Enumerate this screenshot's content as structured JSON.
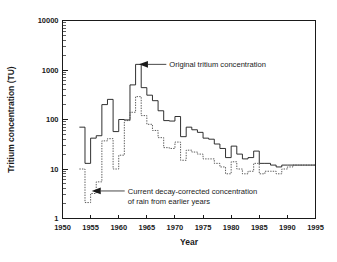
{
  "chart_data": {
    "type": "line",
    "title": "",
    "xlabel": "Year",
    "ylabel": "Tritium concentration (TU)",
    "xlim": [
      1950,
      1995
    ],
    "ylim": [
      1,
      10000
    ],
    "yscale": "log",
    "xscale": "linear",
    "grid": false,
    "legend_position": "none",
    "xticks": [
      1950,
      1955,
      1960,
      1965,
      1970,
      1975,
      1980,
      1985,
      1990,
      1995
    ],
    "xtick_labels": [
      "1950",
      "1955",
      "1960",
      "1965",
      "1970",
      "1975",
      "1980",
      "1985",
      "1990",
      "1995"
    ],
    "yticks": [
      1,
      10,
      100,
      1000,
      10000
    ],
    "ytick_labels": [
      "1",
      "10",
      "100",
      "1000",
      "10000"
    ],
    "plot_style": "step",
    "x": [
      1953,
      1954,
      1955,
      1956,
      1957,
      1958,
      1959,
      1960,
      1961,
      1962,
      1963,
      1964,
      1965,
      1966,
      1967,
      1968,
      1969,
      1970,
      1971,
      1972,
      1973,
      1974,
      1975,
      1976,
      1977,
      1978,
      1979,
      1980,
      1981,
      1982,
      1983,
      1984,
      1985,
      1986,
      1987,
      1988,
      1989,
      1990,
      1991,
      1992,
      1993,
      1994,
      1995
    ],
    "series": [
      {
        "name": "Original tritium concentration",
        "style": "solid",
        "color": "#1a1a1a",
        "values": [
          70,
          13,
          42,
          47,
          200,
          255,
          57,
          100,
          98,
          500,
          1300,
          440,
          310,
          240,
          150,
          95,
          93,
          115,
          45,
          70,
          62,
          55,
          42,
          40,
          32,
          26,
          17,
          29,
          20,
          16,
          17,
          23,
          13,
          13,
          12,
          11,
          12,
          12,
          12,
          12,
          12,
          12,
          12
        ]
      },
      {
        "name": "Current decay-corrected concentration of rain from earlier years",
        "style": "dotted",
        "color": "#4a4a4a",
        "values": [
          10,
          2.1,
          3.2,
          5.5,
          37,
          41,
          10,
          19,
          95,
          140,
          290,
          120,
          80,
          60,
          43,
          27,
          26,
          35,
          15,
          24,
          22,
          20,
          16,
          16,
          13,
          11,
          8,
          14,
          10,
          8,
          9,
          13,
          8,
          9,
          9,
          8,
          10,
          11,
          12,
          12,
          12,
          12,
          12
        ]
      }
    ],
    "annotations": [
      {
        "id": "annotation-original",
        "text_lines": [
          "Original tritium concentration"
        ],
        "target_x": 1963.6,
        "target_y": 1300,
        "text_x": 1969.0,
        "text_y": 1450
      },
      {
        "id": "annotation-decay-corrected",
        "text_lines": [
          "Current decay-corrected concentration",
          "of rain from earlier years"
        ],
        "target_x": 1955.2,
        "target_y": 3.6,
        "text_x": 1961.6,
        "text_y": 4.0
      }
    ]
  }
}
